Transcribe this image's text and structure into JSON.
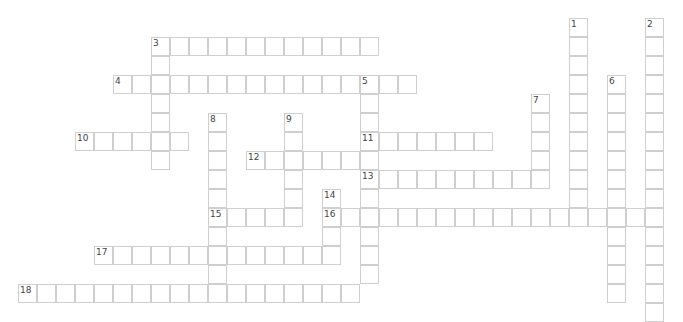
{
  "puzzle": {
    "type": "crossword",
    "origin_x": 18,
    "origin_y": 18,
    "cell_size": 19,
    "border_color": "#cfcfcf",
    "number_color": "#444444",
    "entries": [
      {
        "number": "1",
        "direction": "down",
        "row": 0,
        "col": 29,
        "length": 11
      },
      {
        "number": "2",
        "direction": "down",
        "row": 0,
        "col": 33,
        "length": 16
      },
      {
        "number": "3",
        "direction": "across",
        "row": 1,
        "col": 7,
        "length": 12
      },
      {
        "number": "3",
        "direction": "down",
        "row": 1,
        "col": 7,
        "length": 7
      },
      {
        "number": "4",
        "direction": "across",
        "row": 3,
        "col": 5,
        "length": 16
      },
      {
        "number": "5",
        "direction": "down",
        "row": 3,
        "col": 18,
        "length": 11
      },
      {
        "number": "6",
        "direction": "down",
        "row": 3,
        "col": 31,
        "length": 12
      },
      {
        "number": "7",
        "direction": "down",
        "row": 4,
        "col": 27,
        "length": 5
      },
      {
        "number": "8",
        "direction": "down",
        "row": 5,
        "col": 10,
        "length": 10
      },
      {
        "number": "9",
        "direction": "down",
        "row": 5,
        "col": 14,
        "length": 6
      },
      {
        "number": "10",
        "direction": "across",
        "row": 6,
        "col": 3,
        "length": 6
      },
      {
        "number": "11",
        "direction": "across",
        "row": 6,
        "col": 18,
        "length": 7
      },
      {
        "number": "12",
        "direction": "across",
        "row": 7,
        "col": 12,
        "length": 7
      },
      {
        "number": "13",
        "direction": "across",
        "row": 8,
        "col": 18,
        "length": 10
      },
      {
        "number": "14",
        "direction": "down",
        "row": 9,
        "col": 16,
        "length": 4
      },
      {
        "number": "15",
        "direction": "across",
        "row": 10,
        "col": 10,
        "length": 5
      },
      {
        "number": "16",
        "direction": "across",
        "row": 10,
        "col": 16,
        "length": 18
      },
      {
        "number": "17",
        "direction": "across",
        "row": 12,
        "col": 4,
        "length": 12
      },
      {
        "number": "18",
        "direction": "across",
        "row": 14,
        "col": 0,
        "length": 18
      }
    ]
  }
}
